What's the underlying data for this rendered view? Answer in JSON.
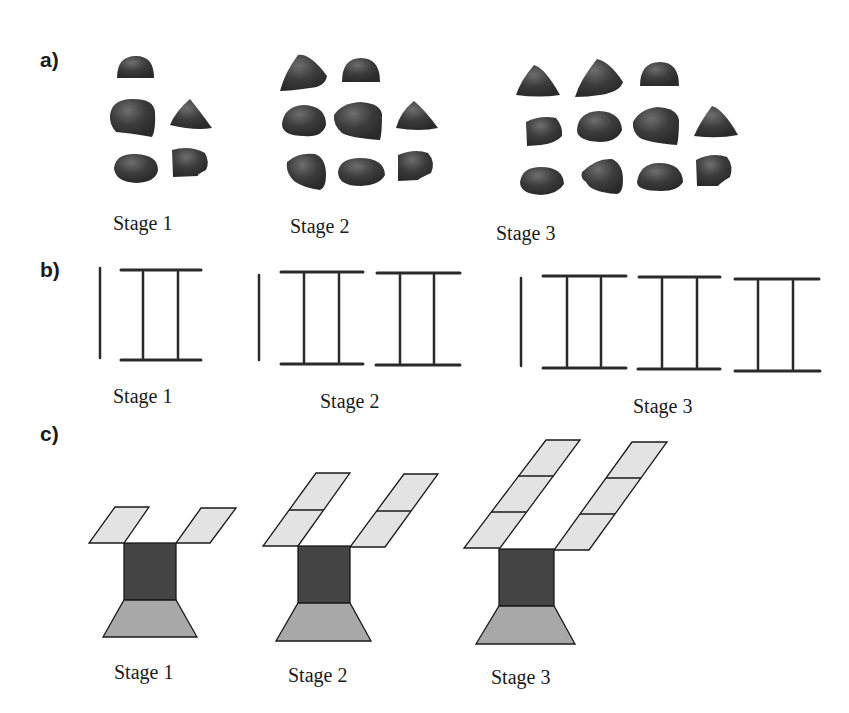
{
  "panels": {
    "a": {
      "label": "a)",
      "stages": [
        {
          "label": "Stage 1",
          "stone_count": 5
        },
        {
          "label": "Stage 2",
          "stone_count": 8
        },
        {
          "label": "Stage 3",
          "stone_count": 11
        }
      ]
    },
    "b": {
      "label": "b)",
      "stages": [
        {
          "label": "Stage 1",
          "frames": 1
        },
        {
          "label": "Stage 2",
          "frames": 2
        },
        {
          "label": "Stage 3",
          "frames": 3
        }
      ]
    },
    "c": {
      "label": "c)",
      "stages": [
        {
          "label": "Stage 1",
          "arm_segments": 1
        },
        {
          "label": "Stage 2",
          "arm_segments": 2
        },
        {
          "label": "Stage 3",
          "arm_segments": 3
        }
      ]
    }
  },
  "colors": {
    "stone": "#3a3a3a",
    "stone_highlight": "#6a6a6a",
    "line": "#2a2a2a",
    "arm_fill": "#e3e3e3",
    "box_fill": "#444444",
    "base_fill": "#a8a8a8",
    "outline": "#1a1a1a"
  }
}
